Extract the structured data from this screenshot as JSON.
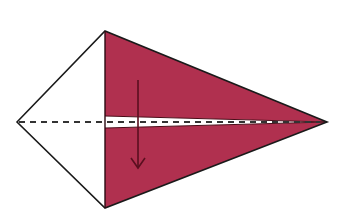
{
  "diagram": {
    "title": "Origami fold step: fold top flap down along center line",
    "colors": {
      "background": "#ffffff",
      "paper_colored": "#b0304f",
      "paper_white": "#ffffff",
      "outline": "#1a1a1a",
      "arrow": "#5a0f1f",
      "crease_dash": "#333333"
    },
    "shapes": {
      "kite_outline": "left vertex, top vertex, right tip, bottom vertex",
      "colored_flaps": "two triangular colored flaps meeting at center line",
      "white_strip": "thin white strip along horizontal center, tapering to the tip",
      "crease_line": "dashed valley-fold line along horizontal axis",
      "fold_arrow": "downward arrow indicating fold direction"
    },
    "elements": [
      {
        "id": "fold-arrow",
        "label": "fold down"
      },
      {
        "id": "crease-line",
        "label": "valley fold"
      }
    ]
  }
}
